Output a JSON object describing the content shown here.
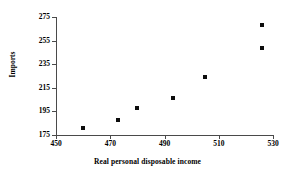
{
  "chart_data": {
    "type": "scatter",
    "title": "",
    "xlabel": "Real personal disposable income",
    "ylabel": "Imports",
    "xlim": [
      450,
      530
    ],
    "ylim": [
      175,
      275
    ],
    "xticks": [
      450,
      470,
      490,
      510,
      530
    ],
    "yticks": [
      175,
      195,
      215,
      235,
      255,
      275
    ],
    "grid": false,
    "legend": false,
    "marker": "square",
    "marker_color": "#0d0d0d",
    "axis_color": "#4a4a4a",
    "points": [
      {
        "x": 460,
        "y": 181
      },
      {
        "x": 473,
        "y": 188
      },
      {
        "x": 480,
        "y": 198
      },
      {
        "x": 493,
        "y": 206
      },
      {
        "x": 505,
        "y": 224
      },
      {
        "x": 526,
        "y": 249
      },
      {
        "x": 526,
        "y": 268
      }
    ],
    "x": [
      460,
      473,
      480,
      493,
      505,
      526,
      526
    ],
    "y": [
      181,
      188,
      198,
      206,
      224,
      249,
      268
    ]
  },
  "axes": {
    "x_tick_labels": [
      "450",
      "470",
      "490",
      "510",
      "530"
    ],
    "y_tick_labels": [
      "175",
      "195",
      "215",
      "235",
      "255",
      "275"
    ],
    "x_title": "Real personal disposable income",
    "y_title": "Imports"
  }
}
